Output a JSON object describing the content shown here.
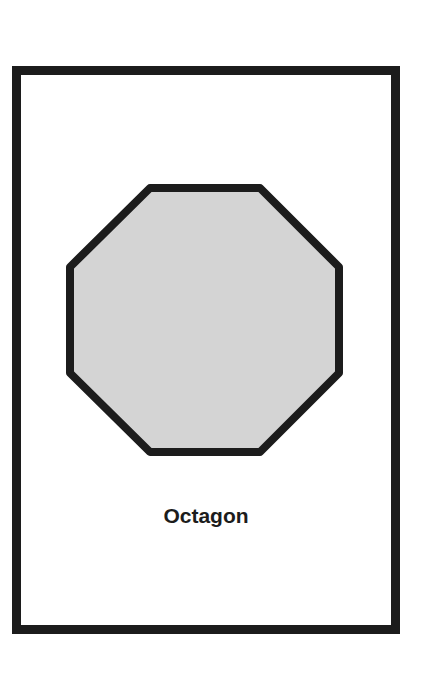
{
  "card": {
    "shape_name": "Octagon",
    "shape_type": "octagon",
    "fill_color": "#d4d4d4",
    "stroke_color": "#1c1c1c",
    "border_color": "#1c1c1c"
  }
}
